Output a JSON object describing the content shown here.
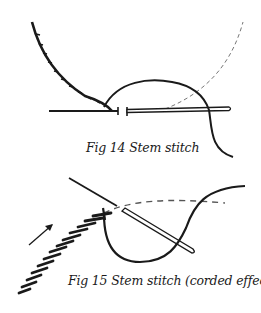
{
  "figures": [
    {
      "id": "fig14",
      "caption": "Fig 14 Stem stitch",
      "elements": [
        "worked-stitch-line",
        "needle",
        "thread-loop",
        "dashed-guide-line"
      ]
    },
    {
      "id": "fig15",
      "caption": "Fig 15 Stem stitch (corded effect)",
      "elements": [
        "worked-corded-stitches",
        "direction-arrow",
        "needle",
        "thread-loop",
        "dashed-guide-line"
      ]
    }
  ],
  "colors": {
    "ink": "#1a1a1a",
    "background": "#ffffff",
    "dashed": "#777777"
  }
}
